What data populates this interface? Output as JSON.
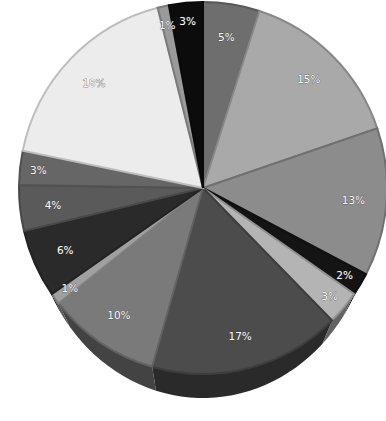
{
  "chart_data": {
    "type": "pie",
    "style": "3d-tilted",
    "title": "",
    "start_angle_deg": 0,
    "direction": "clockwise",
    "slices": [
      {
        "label": "5%",
        "value": 5,
        "color": "#6e6e6e"
      },
      {
        "label": "15%",
        "value": 15,
        "color": "#a9a9a9"
      },
      {
        "label": "13%",
        "value": 13,
        "color": "#8c8c8c"
      },
      {
        "label": "2%",
        "value": 2,
        "color": "#141414"
      },
      {
        "label": "3%",
        "value": 3,
        "color": "#b4b4b4"
      },
      {
        "label": "17%",
        "value": 17,
        "color": "#4c4c4c"
      },
      {
        "label": "10%",
        "value": 10,
        "color": "#7a7a7a"
      },
      {
        "label": "1%",
        "value": 1,
        "color": "#a0a0a0"
      },
      {
        "label": "6%",
        "value": 6,
        "color": "#2a2a2a"
      },
      {
        "label": "4%",
        "value": 4,
        "color": "#5a5a5a"
      },
      {
        "label": "3%",
        "value": 3,
        "color": "#666666"
      },
      {
        "label": "18%",
        "value": 18,
        "color": "#ececec"
      },
      {
        "label": "1%",
        "value": 1,
        "color": "#9a9a9a"
      },
      {
        "label": "3%",
        "value": 3,
        "color": "#0c0c0c"
      }
    ],
    "legend": "none",
    "data_labels": "percent"
  }
}
